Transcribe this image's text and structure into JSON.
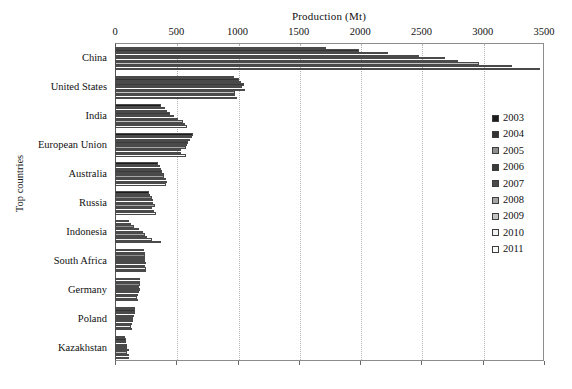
{
  "chart_data": {
    "type": "bar",
    "orientation": "horizontal",
    "title": "Production (Mt)",
    "xlabel": "Production (Mt)",
    "ylabel": "Top countries",
    "xlim": [
      0,
      3500
    ],
    "xticks": [
      0,
      500,
      1000,
      1500,
      2000,
      2500,
      3000,
      3500
    ],
    "xtick_labels": [
      "0",
      "500",
      "1000",
      "1500",
      "2000",
      "2500",
      "3000",
      "3500"
    ],
    "grid": "vertical-dotted",
    "legend_position": "right",
    "categories": [
      "China",
      "United States",
      "India",
      "European Union",
      "Australia",
      "Russia",
      "Indonesia",
      "South Africa",
      "Germany",
      "Poland",
      "Kazakhstan"
    ],
    "series": [
      {
        "name": "2003",
        "color": "#1c1c1c",
        "values": [
          1722,
          972,
          376,
          638,
          351,
          277,
          115,
          238,
          205,
          164,
          85
        ]
      },
      {
        "name": "2004",
        "color": "#333333",
        "values": [
          1992,
          1009,
          408,
          628,
          366,
          282,
          132,
          243,
          208,
          162,
          87
        ]
      },
      {
        "name": "2005",
        "color": "#8f8f8f",
        "values": [
          2226,
          1026,
          428,
          608,
          378,
          299,
          152,
          245,
          203,
          160,
          87
        ]
      },
      {
        "name": "2006",
        "color": "#3a3a3a",
        "values": [
          2482,
          1053,
          448,
          595,
          385,
          310,
          195,
          245,
          197,
          157,
          96
        ]
      },
      {
        "name": "2007",
        "color": "#4a4a4a",
        "values": [
          2692,
          1040,
          478,
          589,
          399,
          314,
          231,
          247,
          201,
          145,
          98
        ]
      },
      {
        "name": "2008",
        "color": "#a6a6a6",
        "values": [
          2802,
          1063,
          515,
          580,
          401,
          327,
          246,
          250,
          192,
          144,
          111
        ]
      },
      {
        "name": "2009",
        "color": "#c4c4c4",
        "values": [
          2971,
          975,
          557,
          538,
          413,
          301,
          263,
          247,
          184,
          135,
          101
        ]
      },
      {
        "name": "2010",
        "color": "#f2f2f2",
        "values": [
          3235,
          983,
          570,
          535,
          424,
          317,
          305,
          255,
          182,
          134,
          111
        ]
      },
      {
        "name": "2011",
        "color": "#fbfbfb",
        "values": [
          3471,
          993,
          588,
          576,
          415,
          334,
          376,
          253,
          189,
          139,
          116
        ]
      }
    ]
  }
}
